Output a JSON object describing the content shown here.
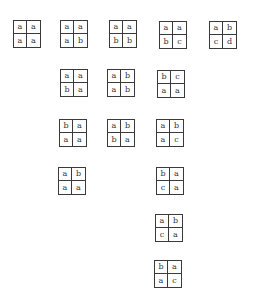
{
  "diagram": {
    "tiles": [
      {
        "id": "r1t1",
        "x": 13,
        "y": 20,
        "cells": [
          "a",
          "a",
          "a",
          "a"
        ]
      },
      {
        "id": "r1t2",
        "x": 60,
        "y": 20,
        "cells": [
          "a",
          "a",
          "a",
          "b"
        ]
      },
      {
        "id": "r1t3",
        "x": 109,
        "y": 20,
        "cells": [
          "a",
          "a",
          "b",
          "b"
        ]
      },
      {
        "id": "r1t4",
        "x": 159,
        "y": 21,
        "cells": [
          "a",
          "a",
          "b",
          "c"
        ]
      },
      {
        "id": "r1t5",
        "x": 209,
        "y": 21,
        "cells": [
          "a",
          "b",
          "c",
          "d"
        ]
      },
      {
        "id": "r2t1",
        "x": 60,
        "y": 69,
        "cells": [
          "a",
          "a",
          "b",
          "a"
        ]
      },
      {
        "id": "r2t2",
        "x": 107,
        "y": 69,
        "cells": [
          "a",
          "b",
          "a",
          "b"
        ]
      },
      {
        "id": "r2t3",
        "x": 157,
        "y": 70,
        "cells": [
          "b",
          "c",
          "a",
          "a"
        ]
      },
      {
        "id": "r3t1",
        "x": 59,
        "y": 119,
        "cells": [
          "b",
          "a",
          "a",
          "a"
        ]
      },
      {
        "id": "r3t2",
        "x": 107,
        "y": 119,
        "cells": [
          "a",
          "b",
          "b",
          "a"
        ]
      },
      {
        "id": "r3t3",
        "x": 156,
        "y": 119,
        "cells": [
          "a",
          "b",
          "a",
          "c"
        ]
      },
      {
        "id": "r4t1",
        "x": 58,
        "y": 167,
        "cells": [
          "a",
          "b",
          "a",
          "a"
        ]
      },
      {
        "id": "r4t2",
        "x": 156,
        "y": 167,
        "cells": [
          "b",
          "a",
          "c",
          "a"
        ]
      },
      {
        "id": "r5t1",
        "x": 155,
        "y": 214,
        "cells": [
          "a",
          "b",
          "c",
          "a"
        ]
      },
      {
        "id": "r6t1",
        "x": 154,
        "y": 260,
        "cells": [
          "b",
          "a",
          "a",
          "c"
        ]
      }
    ],
    "colors": {
      "border": "#3a3a3a",
      "text": "#333333",
      "background": "#ffffff"
    }
  }
}
